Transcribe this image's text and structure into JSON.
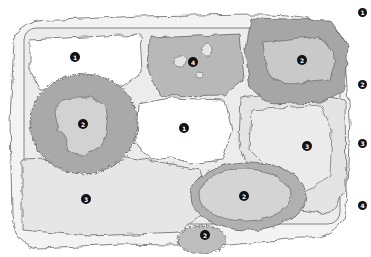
{
  "diagram": {
    "type": "planting-zone-map",
    "colors": {
      "background": "#ffffff",
      "outline": "#555555",
      "zone_1_fill": "#ffffff",
      "zone_2_fill": "#a9a9a9",
      "zone_2_inner_fill": "#d0d0d0",
      "zone_3_fill": "#e8e8e8",
      "zone_4_fill": "#b5b5b5",
      "outer_border_fill": "#f2f2f2",
      "marker_fill": "#111111",
      "marker_text": "#ffffff"
    },
    "markers": [
      {
        "label": "1",
        "x": 75,
        "y": 57
      },
      {
        "label": "4",
        "x": 193,
        "y": 62
      },
      {
        "label": "2",
        "x": 302,
        "y": 60
      },
      {
        "label": "2",
        "x": 83,
        "y": 124
      },
      {
        "label": "1",
        "x": 184,
        "y": 128
      },
      {
        "label": "3",
        "x": 307,
        "y": 146
      },
      {
        "label": "3",
        "x": 86,
        "y": 199
      },
      {
        "label": "2",
        "x": 244,
        "y": 196
      },
      {
        "label": "2",
        "x": 205,
        "y": 235
      }
    ]
  },
  "legend": {
    "items": [
      {
        "label": "1"
      },
      {
        "label": "2"
      },
      {
        "label": "3"
      },
      {
        "label": "4"
      }
    ]
  }
}
